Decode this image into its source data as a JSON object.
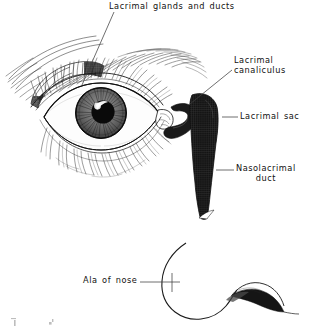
{
  "figure": {
    "medium": "scanned pen-and-ink anatomical line drawing",
    "background_color": "#ffffff",
    "ink_color": "#111111",
    "leader_line_color": "#4a4a4a"
  },
  "labels": {
    "lacrimal_glands_and_ducts": "Lacrimal glands and ducts",
    "lacrimal_canaliculus_line1": "Lacrimal",
    "lacrimal_canaliculus_line2": "canaliculus",
    "lacrimal_sac": "Lacrimal sac",
    "nasolacrimal_duct_line1": "Nasolacrimal",
    "nasolacrimal_duct_line2": "duct",
    "ala_of_nose": "Ala of nose"
  },
  "structures": [
    {
      "name": "eyebrow",
      "description": "arched band of sweeping hair strokes above the eye"
    },
    {
      "name": "lacrimal-gland",
      "description": "lobulated cross-hatched gland under the upper outer lid"
    },
    {
      "name": "upper-eyelid",
      "description": "lid margin with dense upper eyelashes"
    },
    {
      "name": "eyeball",
      "description": "eye with striated iris and dark pupil with highlight"
    },
    {
      "name": "lower-eyelid",
      "description": "lid margin with downward fanning lower eyelashes"
    },
    {
      "name": "lacrimal-canaliculus",
      "description": "hook-shaped dark duct at the medial canthus"
    },
    {
      "name": "lacrimal-sac",
      "description": "dark cross-hatched vertical sac lateral to the nose"
    },
    {
      "name": "nasolacrimal-duct",
      "description": "dark tapering duct descending from the sac"
    },
    {
      "name": "ala-of-nose",
      "description": "curved nasal outline with dark nostril"
    }
  ]
}
